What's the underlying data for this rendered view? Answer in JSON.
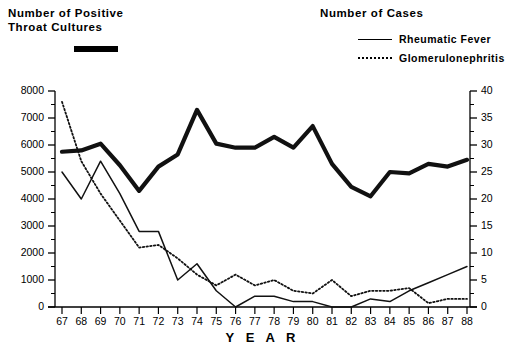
{
  "titles": {
    "left": "Number of Positive\nThroat Cultures",
    "right": "Number of Cases"
  },
  "legend": {
    "throat_cultures_marker": "thick-solid-bar",
    "items": [
      {
        "label": "Rheumatic Fever",
        "style": "solid"
      },
      {
        "label": "Glomerulonephritis",
        "style": "dotted"
      }
    ]
  },
  "axes": {
    "x_title": "Y E A R",
    "y_left_ticks": [
      "0",
      "1000",
      "2000",
      "3000",
      "4000",
      "5000",
      "6000",
      "7000",
      "8000"
    ],
    "y_right_ticks": [
      "0",
      "5",
      "10",
      "15",
      "20",
      "25",
      "30",
      "35",
      "40"
    ],
    "x_ticks": [
      "67",
      "68",
      "69",
      "70",
      "71",
      "72",
      "73",
      "74",
      "75",
      "76",
      "77",
      "78",
      "79",
      "80",
      "81",
      "82",
      "83",
      "84",
      "85",
      "86",
      "87",
      "88"
    ]
  },
  "chart_data": {
    "type": "line",
    "xlabel": "Y E A R",
    "ylabel": "Number of Positive Throat Cultures",
    "y2label": "Number of Cases",
    "xlim": [
      67,
      88
    ],
    "ylim": [
      0,
      8000
    ],
    "y2lim": [
      0,
      40
    ],
    "grid": false,
    "legend_position": "top",
    "x": [
      67,
      68,
      69,
      70,
      71,
      72,
      73,
      74,
      75,
      76,
      77,
      78,
      79,
      80,
      81,
      82,
      83,
      84,
      85,
      86,
      87,
      88
    ],
    "series": [
      {
        "name": "Number of Positive Throat Cultures",
        "axis": "left",
        "style": "thick-solid",
        "values": [
          5750,
          5800,
          6050,
          5250,
          4300,
          5200,
          5650,
          7300,
          6050,
          5900,
          5900,
          6300,
          5900,
          6700,
          5300,
          4450,
          4100,
          5000,
          4950,
          5300,
          5200,
          5450
        ]
      },
      {
        "name": "Rheumatic Fever",
        "axis": "right",
        "style": "solid",
        "values": [
          25,
          20,
          27,
          21,
          14,
          14,
          5,
          8,
          3,
          0,
          2,
          2,
          1,
          1,
          0,
          0,
          1.5,
          1,
          3,
          4.5,
          6,
          7.5
        ]
      },
      {
        "name": "Glomerulonephritis",
        "axis": "right",
        "style": "dotted",
        "values": [
          38,
          27,
          21,
          16,
          11,
          11.5,
          9,
          6,
          4,
          6,
          4,
          5,
          3,
          2.5,
          5,
          2,
          3,
          3,
          3.5,
          0.7,
          1.5,
          1.5
        ]
      }
    ]
  }
}
